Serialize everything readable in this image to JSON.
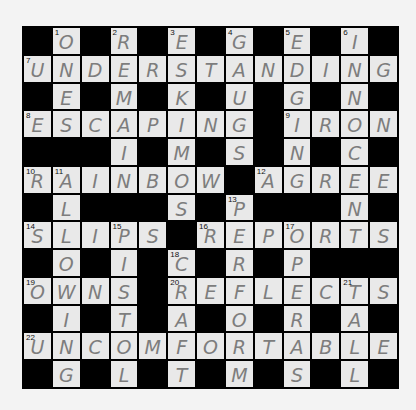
{
  "crossword": {
    "rows": 13,
    "cols": 13,
    "colors": {
      "block": "#000000",
      "cell": "#e9e9e9",
      "letter": "#7d7d7d",
      "number": "#111111",
      "page": "#f3f3f3"
    },
    "grid": [
      "#O#R#E#G#E#I#",
      "UNDERSTANDING",
      "#E#M#K#U#G#N#",
      "ESCAPING#IRON",
      "###I#M#S#N#C#",
      "RAINBOW#AGREE",
      "#L###S#P###N#",
      "SLIPS#REPORTS",
      "#O#I#C#R#P###",
      "OWNS#REFLECTS",
      "#I#T#A#O#R#A#",
      "UNCOMFORTABLE",
      "#G#L#T#M#S#L#"
    ],
    "numbers": [
      {
        "r": 0,
        "c": 1,
        "n": "1"
      },
      {
        "r": 0,
        "c": 3,
        "n": "2"
      },
      {
        "r": 0,
        "c": 5,
        "n": "3"
      },
      {
        "r": 0,
        "c": 7,
        "n": "4"
      },
      {
        "r": 0,
        "c": 9,
        "n": "5"
      },
      {
        "r": 0,
        "c": 11,
        "n": "6"
      },
      {
        "r": 1,
        "c": 0,
        "n": "7"
      },
      {
        "r": 3,
        "c": 0,
        "n": "8"
      },
      {
        "r": 3,
        "c": 9,
        "n": "9"
      },
      {
        "r": 5,
        "c": 0,
        "n": "10"
      },
      {
        "r": 5,
        "c": 1,
        "n": "11"
      },
      {
        "r": 5,
        "c": 8,
        "n": "12"
      },
      {
        "r": 6,
        "c": 7,
        "n": "13"
      },
      {
        "r": 7,
        "c": 0,
        "n": "14"
      },
      {
        "r": 7,
        "c": 3,
        "n": "15"
      },
      {
        "r": 7,
        "c": 6,
        "n": "16"
      },
      {
        "r": 7,
        "c": 9,
        "n": "17"
      },
      {
        "r": 8,
        "c": 5,
        "n": "18"
      },
      {
        "r": 9,
        "c": 0,
        "n": "19"
      },
      {
        "r": 9,
        "c": 5,
        "n": "20"
      },
      {
        "r": 9,
        "c": 11,
        "n": "21"
      },
      {
        "r": 11,
        "c": 0,
        "n": "22"
      }
    ],
    "answers": {
      "across": [
        {
          "n": "7",
          "answer": "UNDERSTANDING"
        },
        {
          "n": "8",
          "answer": "ESCAPING"
        },
        {
          "n": "9",
          "answer": "IRON"
        },
        {
          "n": "10",
          "answer": "RAINBOW"
        },
        {
          "n": "12",
          "answer": "AGREE"
        },
        {
          "n": "14",
          "answer": "SLIPS"
        },
        {
          "n": "16",
          "answer": "REPORTS"
        },
        {
          "n": "19",
          "answer": "OWNS"
        },
        {
          "n": "20",
          "answer": "REFLECTS"
        },
        {
          "n": "22",
          "answer": "UNCOMFORTABLE"
        }
      ],
      "down": [
        {
          "n": "1",
          "answer": "ONE"
        },
        {
          "n": "2",
          "answer": "REMAIN"
        },
        {
          "n": "3",
          "answer": "ESKIMOS"
        },
        {
          "n": "4",
          "answer": "GAUGES"
        },
        {
          "n": "5",
          "answer": "EDGING"
        },
        {
          "n": "6",
          "answer": "INNOCENT"
        },
        {
          "n": "11",
          "answer": "ALLOWING"
        },
        {
          "n": "13",
          "answer": "PERFORM"
        },
        {
          "n": "15",
          "answer": "PISTOL"
        },
        {
          "n": "17",
          "answer": "OPERAS"
        },
        {
          "n": "18",
          "answer": "CRAFT"
        },
        {
          "n": "21",
          "answer": "TALL"
        }
      ]
    }
  }
}
